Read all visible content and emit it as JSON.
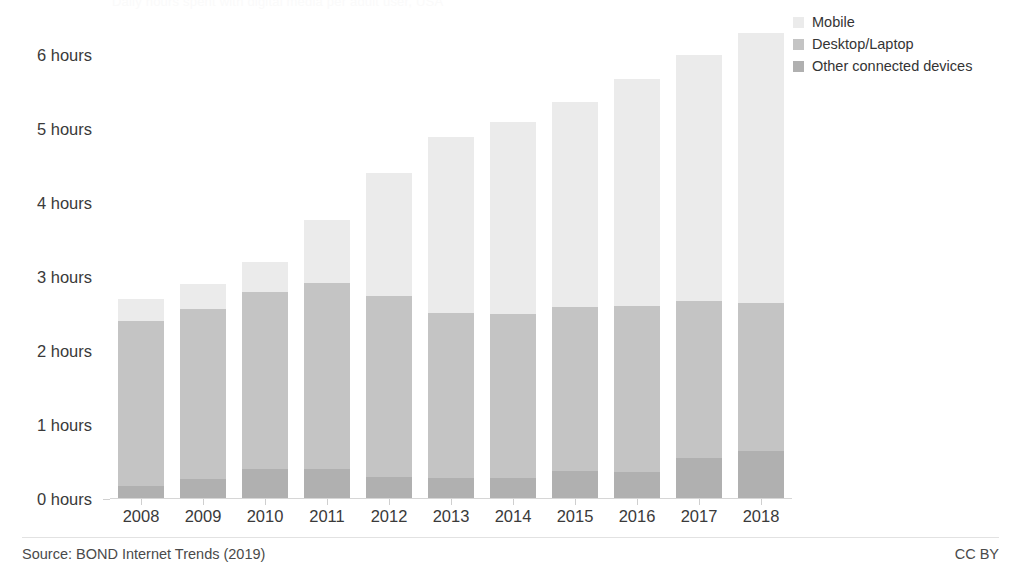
{
  "chart_data": {
    "type": "bar",
    "stacked": true,
    "title": "Daily hours spent with digital media per adult user, USA",
    "subtitle": "",
    "xlabel": "",
    "ylabel": "",
    "ylim": [
      0,
      6.5
    ],
    "y_tick_values": [
      0,
      1,
      2,
      3,
      4,
      5,
      6
    ],
    "y_tick_labels": [
      "0 hours",
      "1 hours",
      "2 hours",
      "3 hours",
      "4 hours",
      "5 hours",
      "6 hours"
    ],
    "grid": false,
    "legend_position": "top-right",
    "categories": [
      "2008",
      "2009",
      "2010",
      "2011",
      "2012",
      "2013",
      "2014",
      "2015",
      "2016",
      "2017",
      "2018"
    ],
    "series": [
      {
        "name": "Other connected devices",
        "color": "#b0b0b0",
        "values": [
          0.17,
          0.27,
          0.4,
          0.4,
          0.3,
          0.28,
          0.29,
          0.38,
          0.37,
          0.55,
          0.65
        ]
      },
      {
        "name": "Desktop/Laptop",
        "color": "#c4c4c4",
        "values": [
          2.23,
          2.3,
          2.4,
          2.52,
          2.45,
          2.23,
          2.21,
          2.21,
          2.24,
          2.12,
          2.0
        ]
      },
      {
        "name": "Mobile",
        "color": "#ebebeb",
        "values": [
          0.3,
          0.33,
          0.4,
          0.85,
          1.65,
          2.38,
          2.6,
          2.78,
          3.06,
          3.33,
          3.65
        ]
      }
    ],
    "totals": [
      2.7,
      2.9,
      3.2,
      3.77,
      4.4,
      4.89,
      5.1,
      5.37,
      5.67,
      6.0,
      6.3
    ],
    "units": "hours per day",
    "scale": {
      "y_max_px": 6.5,
      "px_per_unit": 74
    }
  },
  "legend": {
    "items": [
      {
        "label": "Mobile",
        "color": "#ebebeb",
        "swatch_icon": "legend-swatch-icon"
      },
      {
        "label": "Desktop/Laptop",
        "color": "#c4c4c4",
        "swatch_icon": "legend-swatch-icon"
      },
      {
        "label": "Other connected devices",
        "color": "#b0b0b0",
        "swatch_icon": "legend-swatch-icon"
      }
    ]
  },
  "footer": {
    "source": "Source: BOND Internet Trends (2019)",
    "license": "CC BY"
  },
  "colors": {
    "mobile": "#ebebeb",
    "desktop": "#c4c4c4",
    "other": "#b0b0b0",
    "axis": "#d4d4d4",
    "text": "#3a3a3a",
    "background": "#ffffff"
  }
}
